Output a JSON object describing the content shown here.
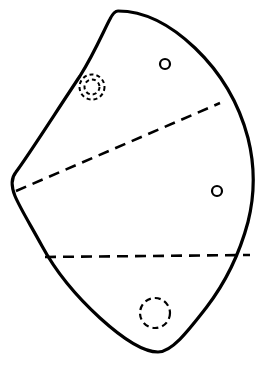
{
  "figure": {
    "title": "",
    "canvas": {
      "width": 263,
      "height": 371,
      "background": "#ffffff"
    },
    "colors": {
      "outline": "#000000",
      "dashed_line": "#000000",
      "marker": "#000000",
      "fill": "#ffffff"
    },
    "outline": {
      "name": "irregular-blob-outline",
      "stroke_width": 3.2,
      "style": "solid",
      "closed": true,
      "path": "M 118 11 C 146 11 172 26 195 48 C 218 70 238 100 248 138 C 256 170 254 198 248 222 C 240 252 226 282 206 308 C 188 331 172 352 158 352 C 142 352 122 338 100 318 C 76 296 56 272 42 246 C 30 224 20 208 15 196 C 11 186 11 178 16 172 C 28 156 56 112 80 76 C 95 52 104 30 110 19 C 113 13 115 11 118 11 Z",
      "extremes": {
        "top_apex": [
          118,
          11
        ],
        "leftmost": [
          13,
          190
        ],
        "rightmost": [
          252,
          215
        ],
        "bottom": [
          160,
          352
        ]
      }
    },
    "dashed_lines": [
      {
        "name": "upper-chord",
        "x1": 16,
        "y1": 191,
        "x2": 220,
        "y2": 103,
        "dash": "11 7",
        "stroke_width": 2.6
      },
      {
        "name": "lower-chord",
        "x1": 45,
        "y1": 257,
        "x2": 250,
        "y2": 255,
        "dash": "11 7",
        "stroke_width": 2.6
      }
    ],
    "markers": [
      {
        "name": "concentric-dashed-circle",
        "type": "double-dashed-circle",
        "cx": 92,
        "cy": 87,
        "r_outer": 12.5,
        "r_inner": 7.5,
        "stroke_width": 2.0,
        "dash": "4 3"
      },
      {
        "name": "small-circle-upper",
        "type": "solid-circle",
        "cx": 165,
        "cy": 64,
        "r": 5.0,
        "stroke_width": 2.2,
        "dash": "none"
      },
      {
        "name": "small-circle-lower",
        "type": "solid-circle",
        "cx": 217,
        "cy": 191,
        "r": 5.0,
        "stroke_width": 2.2,
        "dash": "none"
      },
      {
        "name": "dashed-circle-bottom",
        "type": "dashed-circle",
        "cx": 155,
        "cy": 313,
        "r": 15.0,
        "stroke_width": 2.2,
        "dash": "6 4"
      }
    ],
    "regions": [
      {
        "name": "region-upper",
        "label": ""
      },
      {
        "name": "region-middle",
        "label": ""
      },
      {
        "name": "region-lower",
        "label": ""
      }
    ]
  }
}
